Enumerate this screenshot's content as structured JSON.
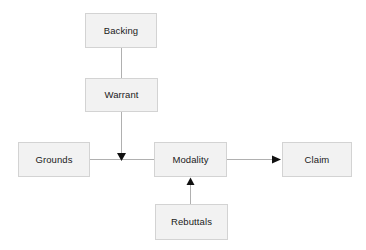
{
  "diagram": {
    "type": "flowchart",
    "background_color": "#ffffff",
    "node_fill_color": "#f2f2f2",
    "node_border_color": "#d3d3d3",
    "edge_color": "#b0b0b0",
    "arrowhead_color": "#111111",
    "text_color": "#1a1a1a",
    "nodes": [
      {
        "id": "backing",
        "label": "Backing",
        "x": 85,
        "y": 13,
        "width": 72,
        "height": 35
      },
      {
        "id": "warrant",
        "label": "Warrant",
        "x": 85,
        "y": 78,
        "width": 73,
        "height": 34
      },
      {
        "id": "grounds",
        "label": "Grounds",
        "x": 18,
        "y": 142,
        "width": 72,
        "height": 35
      },
      {
        "id": "modality",
        "label": "Modality",
        "x": 154,
        "y": 142,
        "width": 73,
        "height": 35
      },
      {
        "id": "claim",
        "label": "Claim",
        "x": 282,
        "y": 142,
        "width": 70,
        "height": 35
      },
      {
        "id": "rebuttals",
        "label": "Rebuttals",
        "x": 155,
        "y": 204,
        "width": 73,
        "height": 36
      }
    ],
    "edges": [
      {
        "id": "backing-to-warrant",
        "from": "backing",
        "to": "warrant",
        "arrowhead": "none"
      },
      {
        "id": "warrant-to-modality",
        "from": "warrant",
        "to": "modality",
        "arrowhead": "down"
      },
      {
        "id": "grounds-to-modality",
        "from": "grounds",
        "to": "modality",
        "arrowhead": "none"
      },
      {
        "id": "modality-to-claim",
        "from": "modality",
        "to": "claim",
        "arrowhead": "right"
      },
      {
        "id": "rebuttals-to-modality",
        "from": "rebuttals",
        "to": "modality",
        "arrowhead": "up"
      }
    ]
  }
}
